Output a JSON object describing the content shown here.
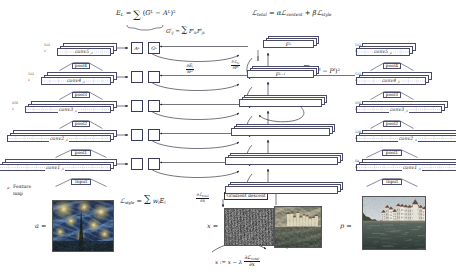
{
  "figure": {
    "kind": "neural-style-transfer-architecture",
    "equations": {
      "style_layer_loss": "E_L = ∑ (G^L − A^L)²",
      "total_loss": "ℒ_total = αℒ_content + βℒ_style",
      "gram_matrix": "G^l_ij = ∑_k F^l_ik F^l_jk",
      "content_loss": "ℒ_content = ∑_l (F^l − P^l)²",
      "style_loss": "ℒ_style = ∑_l w_l E_l",
      "grad_style": "∂E_l / ∂F^l",
      "grad_content": "∂ℒ_content / ∂F^l",
      "grad_input": "∂ℒ_total / ∂x",
      "update_rule": "x := x − λ (∂ℒ_total / ∂x)"
    },
    "gradient_descent_label": "Gradient descent",
    "feature_map_label": "Feature map",
    "feature_map_marker": "a",
    "style_column": {
      "name": "style-network",
      "layers": [
        {
          "label": "conv5",
          "sub": "1",
          "channels": "512",
          "type": "conv"
        },
        {
          "label": "pool4",
          "type": "pool"
        },
        {
          "label": "conv4",
          "sub": "1",
          "channels": "512",
          "type": "conv"
        },
        {
          "label": "pool3",
          "type": "pool"
        },
        {
          "label": "conv3",
          "sub": "1",
          "channels": "256",
          "type": "conv"
        },
        {
          "label": "pool2",
          "type": "pool"
        },
        {
          "label": "conv2",
          "sub": "1",
          "channels": "128",
          "type": "conv"
        },
        {
          "label": "pool1",
          "type": "pool"
        },
        {
          "label": "conv1",
          "sub": "1",
          "channels": "64",
          "type": "conv"
        },
        {
          "label": "Input",
          "type": "input"
        }
      ],
      "image_label": "a =",
      "image_name": "style-image-starry-night"
    },
    "content_column": {
      "name": "content-network",
      "layers": [
        {
          "label": "conv5",
          "sub": "1",
          "channels": "512",
          "type": "conv"
        },
        {
          "label": "pool4",
          "type": "pool"
        },
        {
          "label": "conv4",
          "sub": "1",
          "channels": "512",
          "type": "conv"
        },
        {
          "label": "pool3",
          "type": "pool"
        },
        {
          "label": "conv3",
          "sub": "1",
          "channels": "256",
          "type": "conv"
        },
        {
          "label": "pool2",
          "type": "pool"
        },
        {
          "label": "conv2",
          "sub": "1",
          "channels": "128",
          "type": "conv"
        },
        {
          "label": "pool1",
          "type": "pool"
        },
        {
          "label": "conv1",
          "sub": "1",
          "channels": "64",
          "type": "conv"
        },
        {
          "label": "Input",
          "type": "input"
        }
      ],
      "image_label": "p =",
      "image_name": "content-image-tuebingen"
    },
    "gram_boxes": [
      {
        "a": "A^L",
        "g": "G^L",
        "labeled": true
      },
      {
        "a": "",
        "g": "",
        "labeled": false
      },
      {
        "a": "",
        "g": "",
        "labeled": false
      },
      {
        "a": "",
        "g": "",
        "labeled": false
      },
      {
        "a": "",
        "g": "",
        "labeled": false
      }
    ],
    "feature_boxes": [
      {
        "label": "F^L"
      },
      {
        "label": "F^{L-1}"
      },
      {
        "label": ""
      },
      {
        "label": ""
      },
      {
        "label": ""
      }
    ],
    "generated": {
      "label": "x =",
      "noise_name": "generated-image-noise",
      "result_name": "generated-image-result"
    },
    "colors": {
      "stroke": "#4a4a6a",
      "arrow": "#2a2a3a",
      "text": "#1a1a1a",
      "box_fill": "#ffffff"
    }
  }
}
